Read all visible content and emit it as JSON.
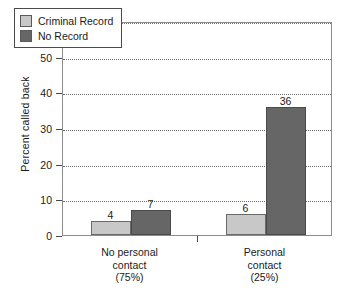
{
  "chart_data": {
    "type": "bar",
    "title": "",
    "subtitle": "",
    "xlabel": "",
    "ylabel": "Percent called back",
    "ylim": [
      0,
      60
    ],
    "yticks": [
      0,
      10,
      20,
      30,
      40,
      50,
      60
    ],
    "ytick_labels": [
      "0",
      "10",
      "20",
      "30",
      "40",
      "50",
      "60"
    ],
    "grid": "horizontal-dotted",
    "legend_position": "top-left-inside",
    "categories": [
      "No personal contact\n(75%)",
      "Personal contact\n(25%)"
    ],
    "category_lines": [
      [
        "No personal",
        "contact",
        "(75%)"
      ],
      [
        "Personal",
        "contact",
        "(25%)"
      ]
    ],
    "series": [
      {
        "name": "Criminal Record",
        "color": "#c8c8c8",
        "values": [
          4,
          6
        ],
        "labels": [
          "4",
          "6"
        ]
      },
      {
        "name": "No Record",
        "color": "#666666",
        "values": [
          7,
          36
        ],
        "labels": [
          "7",
          "36"
        ]
      }
    ]
  },
  "legend": {
    "items": [
      {
        "label": "Criminal Record",
        "swatch": "light"
      },
      {
        "label": "No Record",
        "swatch": "dark"
      }
    ]
  },
  "axis": {
    "y_title": "Percent called back",
    "y_labels": [
      "60",
      "50",
      "40",
      "30",
      "20",
      "10",
      "0"
    ]
  },
  "colors": {
    "criminal_record": "#c8c8c8",
    "no_record": "#666666",
    "axis": "#4a4a4a",
    "grid": "#6e6e6e",
    "background": "#ffffff"
  }
}
